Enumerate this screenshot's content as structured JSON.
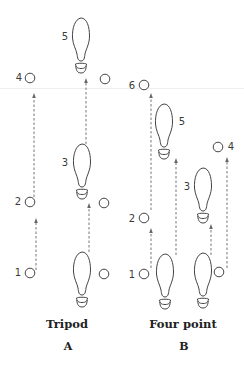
{
  "colors": {
    "stroke": "#444444",
    "arrow": "#666666",
    "text": "#222222",
    "number": "#3a3a3a"
  },
  "panels": [
    {
      "id": "A",
      "title": "Tripod",
      "letter": "A",
      "title_x": 67,
      "circles": [
        {
          "cx": 30,
          "cy": 78,
          "label": "4",
          "lx": 19,
          "ly": 78
        },
        {
          "cx": 105,
          "cy": 79,
          "label": "",
          "lx": 0,
          "ly": 0
        },
        {
          "cx": 30,
          "cy": 202,
          "label": "2",
          "lx": 18,
          "ly": 202
        },
        {
          "cx": 104,
          "cy": 203,
          "label": "",
          "lx": 0,
          "ly": 0
        },
        {
          "cx": 30,
          "cy": 273,
          "label": "1",
          "lx": 18,
          "ly": 273
        },
        {
          "cx": 104,
          "cy": 274,
          "label": "",
          "lx": 0,
          "ly": 0
        }
      ],
      "feet": [
        {
          "x": 72,
          "y": 18,
          "label": "5",
          "lx": 65,
          "ly": 37
        },
        {
          "x": 73,
          "y": 144,
          "label": "3",
          "lx": 65,
          "ly": 163
        },
        {
          "x": 73,
          "y": 252,
          "label": "",
          "lx": 0,
          "ly": 0
        }
      ],
      "arrows": [
        {
          "x": 36,
          "y1": 270,
          "y2": 218
        },
        {
          "x": 34,
          "y1": 197,
          "y2": 93
        },
        {
          "x": 89,
          "y1": 252,
          "y2": 203
        },
        {
          "x": 86,
          "y1": 144,
          "y2": 78
        }
      ]
    },
    {
      "id": "B",
      "title": "Four point",
      "letter": "B",
      "title_x": 183,
      "circles": [
        {
          "cx": 144,
          "cy": 85,
          "label": "6",
          "lx": 132,
          "ly": 86
        },
        {
          "cx": 218,
          "cy": 147,
          "label": "4",
          "lx": 231,
          "ly": 147
        },
        {
          "cx": 144,
          "cy": 218,
          "label": "2",
          "lx": 132,
          "ly": 219
        },
        {
          "cx": 144,
          "cy": 274,
          "label": "1",
          "lx": 132,
          "ly": 275
        },
        {
          "cx": 219,
          "cy": 272,
          "label": "",
          "lx": 0,
          "ly": 0
        }
      ],
      "feet": [
        {
          "x": 155,
          "y": 104,
          "label": "5",
          "lx": 182,
          "ly": 122
        },
        {
          "x": 194,
          "y": 168,
          "label": "3",
          "lx": 187,
          "ly": 187
        },
        {
          "x": 156,
          "y": 254,
          "label": "",
          "lx": 0,
          "ly": 0
        },
        {
          "x": 194,
          "y": 253,
          "label": "",
          "lx": 0,
          "ly": 0
        }
      ],
      "arrows": [
        {
          "x": 151,
          "y1": 268,
          "y2": 228
        },
        {
          "x": 151,
          "y1": 210,
          "y2": 93
        },
        {
          "x": 176,
          "y1": 255,
          "y2": 158
        },
        {
          "x": 211,
          "y1": 255,
          "y2": 224
        },
        {
          "x": 227,
          "y1": 268,
          "y2": 157
        }
      ]
    }
  ]
}
